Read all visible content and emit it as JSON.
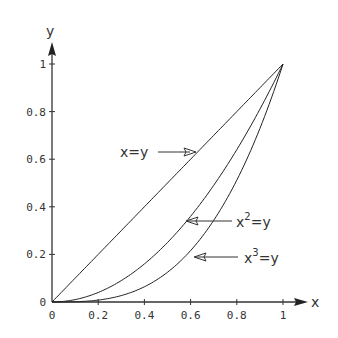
{
  "chart_data": {
    "type": "line",
    "title": "",
    "xlabel": "x",
    "ylabel": "y",
    "xlim": [
      0,
      1
    ],
    "ylim": [
      0,
      1
    ],
    "grid": false,
    "x_ticks": [
      "0",
      "0.2",
      "0.4",
      "0.6",
      "0.8",
      "1"
    ],
    "y_ticks": [
      "0",
      "0.2",
      "0.4",
      "0.6",
      "0.8",
      "1"
    ],
    "x": [
      0,
      0.1,
      0.2,
      0.3,
      0.4,
      0.5,
      0.6,
      0.7,
      0.8,
      0.9,
      1.0
    ],
    "series": [
      {
        "name": "x=y",
        "values": [
          0,
          0.1,
          0.2,
          0.3,
          0.4,
          0.5,
          0.6,
          0.7,
          0.8,
          0.9,
          1.0
        ]
      },
      {
        "name": "x^2=y",
        "values": [
          0,
          0.01,
          0.04,
          0.09,
          0.16,
          0.25,
          0.36,
          0.49,
          0.64,
          0.81,
          1.0
        ]
      },
      {
        "name": "x^3=y",
        "values": [
          0,
          0.001,
          0.008,
          0.027,
          0.064,
          0.125,
          0.216,
          0.343,
          0.512,
          0.729,
          1.0
        ]
      }
    ],
    "annotations": [
      {
        "text": "x=y",
        "arrow": "right",
        "points_to_series": "x=y"
      },
      {
        "text": "x²=y",
        "arrow": "left",
        "points_to_series": "x^2=y"
      },
      {
        "text": "x³=y",
        "arrow": "left",
        "points_to_series": "x^3=y"
      }
    ],
    "legend": "none (inline annotations with arrows)"
  },
  "labels": {
    "x_axis": "x",
    "y_axis": "y",
    "ann_linear_base": "x=y",
    "ann_square_base": "x",
    "ann_square_exp": "2",
    "ann_square_rest": "=y",
    "ann_cube_base": "x",
    "ann_cube_exp": "3",
    "ann_cube_rest": "=y"
  },
  "colors": {
    "line": "#222222",
    "axis": "#333333",
    "text": "#333333",
    "background": "#ffffff"
  }
}
